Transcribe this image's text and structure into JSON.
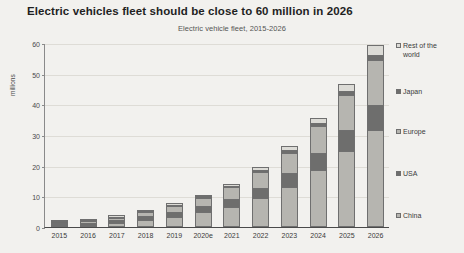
{
  "chart_data": {
    "type": "bar",
    "stacked": true,
    "title": "Electric vehicles fleet should be close to 60 million in 2026",
    "subtitle": "Electric vehicle fleet, 2015-2026",
    "xlabel": "",
    "ylabel": "millions",
    "ylim": [
      0,
      60
    ],
    "yticks": [
      0,
      10,
      20,
      30,
      40,
      50,
      60
    ],
    "grid": true,
    "legend_position": "right",
    "categories": [
      "2015",
      "2016",
      "2017",
      "2018",
      "2019",
      "2020e",
      "2021",
      "2022",
      "2023",
      "2024",
      "2025",
      "2026"
    ],
    "series": [
      {
        "name": "China",
        "color": "#b6b5b0",
        "values": [
          0.4,
          0.8,
          1.4,
          2.4,
          3.4,
          4.8,
          6.5,
          9.4,
          13.2,
          18.6,
          24.8,
          31.5
        ]
      },
      {
        "name": "USA",
        "color": "#6e6e6d",
        "values": [
          0.4,
          0.5,
          0.8,
          1.1,
          1.5,
          2.0,
          2.6,
          3.4,
          4.4,
          5.6,
          6.8,
          8.3
        ]
      },
      {
        "name": "Europe",
        "color": "#b6b5b0",
        "values": [
          0.3,
          0.5,
          0.8,
          1.3,
          1.9,
          2.8,
          3.8,
          5.1,
          6.7,
          8.6,
          11.3,
          14.6
        ]
      },
      {
        "name": "Japan",
        "color": "#6e6e6d",
        "values": [
          0.1,
          0.1,
          0.2,
          0.3,
          0.3,
          0.4,
          0.5,
          0.6,
          0.8,
          1.0,
          1.3,
          1.7
        ]
      },
      {
        "name": "Rest of the world",
        "color": "#dcdbd6",
        "values": [
          0.1,
          0.2,
          0.2,
          0.3,
          0.5,
          0.6,
          0.7,
          1.0,
          1.4,
          1.8,
          2.6,
          3.4
        ]
      }
    ],
    "totals": [
      1.3,
      2.1,
      3.4,
      5.4,
      7.6,
      10.6,
      14.1,
      19.5,
      26.5,
      35.6,
      46.8,
      59.5
    ]
  }
}
